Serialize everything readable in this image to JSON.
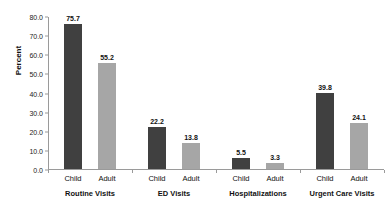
{
  "chart_data": {
    "type": "bar",
    "title": "",
    "xlabel": "",
    "ylabel": "Percent",
    "ylim": [
      0,
      80
    ],
    "ytick_step": 10,
    "grid": false,
    "legend_position": "none",
    "categories": [
      "Routine Visits",
      "ED Visits",
      "Hospitalizations",
      "Urgent Care Visits"
    ],
    "series": [
      {
        "name": "Child",
        "color": "#404040",
        "values": [
          75.7,
          22.2,
          5.5,
          39.8
        ]
      },
      {
        "name": "Adult",
        "color": "#a6a6a6",
        "values": [
          55.2,
          13.8,
          3.3,
          24.1
        ]
      }
    ],
    "ytick_labels": [
      "0.0",
      "10.0",
      "20.0",
      "30.0",
      "40.0",
      "50.0",
      "60.0",
      "70.0",
      "80.0"
    ],
    "data_labels": [
      [
        "75.7",
        "55.2"
      ],
      [
        "22.2",
        "13.8"
      ],
      [
        "5.5",
        "3.3"
      ],
      [
        "39.8",
        "24.1"
      ]
    ],
    "series_labels_row": [
      "Child",
      "Adult",
      "Child",
      "Adult",
      "Child",
      "Adult",
      "Child",
      "Adult"
    ]
  }
}
